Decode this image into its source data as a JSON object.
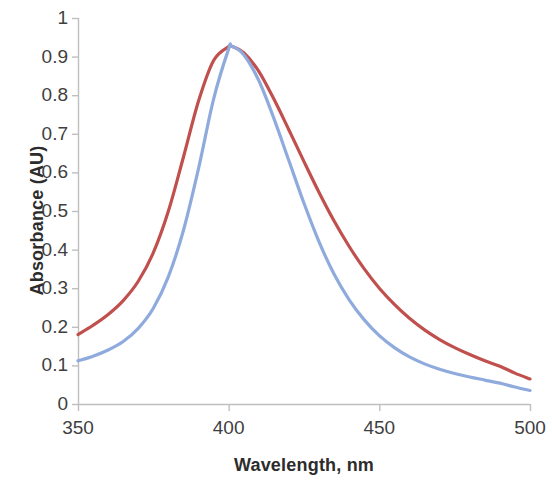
{
  "chart_data": {
    "type": "line",
    "title": "",
    "xlabel": "Wavelength, nm",
    "ylabel": "Absorbance (AU)",
    "xlim": [
      350,
      500
    ],
    "ylim": [
      0,
      1
    ],
    "xticks": [
      "350",
      "400",
      "450",
      "500"
    ],
    "yticks": [
      "1",
      "0.9",
      "0.8",
      "0.7",
      "0.6",
      "0.5",
      "0.4",
      "0.3",
      "0.2",
      "0.1",
      "0"
    ],
    "grid": false,
    "legend": "none",
    "colors": {
      "series_red": "#C0504D",
      "series_blue": "#8FAADC",
      "axis": "#BFBFBF",
      "tick_text": "#3F3F3F",
      "axis_title": "#2C2C2C",
      "background": "#FFFFFF"
    },
    "x": [
      350,
      355,
      360,
      365,
      370,
      375,
      380,
      385,
      390,
      395,
      400,
      401,
      405,
      410,
      415,
      420,
      425,
      430,
      435,
      440,
      445,
      450,
      455,
      460,
      465,
      470,
      475,
      480,
      485,
      490,
      495,
      500
    ],
    "series": [
      {
        "name": "Broad spectrum",
        "color": "#C0504D",
        "values": [
          0.18,
          0.204,
          0.232,
          0.268,
          0.318,
          0.392,
          0.5,
          0.64,
          0.785,
          0.89,
          0.926,
          0.927,
          0.91,
          0.862,
          0.79,
          0.71,
          0.628,
          0.548,
          0.474,
          0.408,
          0.35,
          0.3,
          0.258,
          0.222,
          0.192,
          0.167,
          0.146,
          0.128,
          0.112,
          0.098,
          0.08,
          0.065
        ]
      },
      {
        "name": "Narrow spectrum",
        "color": "#8FAADC",
        "values": [
          0.112,
          0.124,
          0.14,
          0.162,
          0.196,
          0.248,
          0.33,
          0.45,
          0.61,
          0.79,
          0.92,
          0.927,
          0.905,
          0.838,
          0.74,
          0.63,
          0.52,
          0.42,
          0.336,
          0.27,
          0.218,
          0.177,
          0.146,
          0.122,
          0.104,
          0.09,
          0.079,
          0.07,
          0.062,
          0.054,
          0.044,
          0.035
        ]
      }
    ]
  }
}
